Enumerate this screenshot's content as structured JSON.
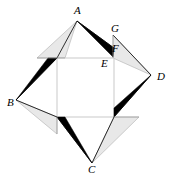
{
  "figure": {
    "type": "geometric-diagram",
    "canvas": {
      "width": 178,
      "height": 182,
      "background": "#ffffff"
    },
    "colors": {
      "dark_fill": "#000000",
      "light_fill": "#e8e8e8",
      "light_stroke": "#b9b9b9",
      "outline_stroke": "#000000",
      "square_stroke": "#c9c9c9",
      "label_color": "#000000"
    },
    "inner_square": {
      "name": "inner-square",
      "corners": [
        {
          "name": "top-left",
          "x": 57,
          "y": 58
        },
        {
          "name": "top-right",
          "x": 114,
          "y": 58
        },
        {
          "name": "bottom-right",
          "x": 114,
          "y": 117
        },
        {
          "name": "bottom-left",
          "x": 57,
          "y": 117
        }
      ]
    },
    "outer_points": [
      {
        "label": "A",
        "x": 77,
        "y": 21
      },
      {
        "label": "B",
        "x": 16,
        "y": 100
      },
      {
        "label": "C",
        "x": 92,
        "y": 163
      },
      {
        "label": "D",
        "x": 151,
        "y": 75
      }
    ],
    "dark_triangles": [
      {
        "name": "dark-triangle-top",
        "points": "77,21 114,48 113,57"
      },
      {
        "name": "dark-triangle-left",
        "points": "16,100 48,58 57,58"
      },
      {
        "name": "dark-triangle-bottom",
        "points": "92,163 57,117 65,117"
      },
      {
        "name": "dark-triangle-right",
        "points": "151,75 114,117 114,108"
      }
    ],
    "light_triangles": [
      {
        "name": "light-triangle-top-left",
        "points": "77,21 37,58 65,58"
      },
      {
        "name": "light-triangle-bottom-left",
        "points": "16,100 57,117 57,134"
      },
      {
        "name": "light-triangle-bottom-right",
        "points": "92,163 114,117 139,117"
      },
      {
        "name": "light-triangle-top-right",
        "points": "151,75 113,35 113,58"
      }
    ],
    "labels": [
      {
        "id": "A",
        "text": "A",
        "x": 74,
        "y": 5
      },
      {
        "id": "B",
        "text": "B",
        "x": 7,
        "y": 97
      },
      {
        "id": "C",
        "text": "C",
        "x": 88,
        "y": 164
      },
      {
        "id": "D",
        "text": "D",
        "x": 157,
        "y": 71
      },
      {
        "id": "E",
        "text": "E",
        "x": 101,
        "y": 58
      },
      {
        "id": "F",
        "text": "F",
        "x": 112,
        "y": 43
      },
      {
        "id": "G",
        "text": "G",
        "x": 111,
        "y": 23
      }
    ]
  }
}
